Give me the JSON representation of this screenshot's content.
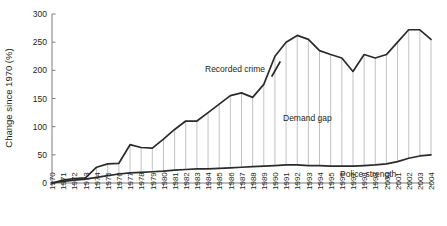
{
  "chart_data": {
    "type": "line",
    "title": "",
    "subtitle": "",
    "xlabel": "",
    "ylabel": "Change since 1970 (%)",
    "ylim": [
      0,
      300
    ],
    "yticks": [
      0,
      50,
      100,
      150,
      200,
      250,
      300
    ],
    "ytick_labels": [
      "0",
      "50",
      "100",
      "150",
      "200",
      "250",
      "300"
    ],
    "grid": false,
    "legend_position": "inline-annotations",
    "x": [
      1970,
      1971,
      1972,
      1973,
      1974,
      1975,
      1976,
      1977,
      1978,
      1979,
      1980,
      1981,
      1982,
      1983,
      1984,
      1985,
      1986,
      1987,
      1988,
      1989,
      1990,
      1991,
      1992,
      1993,
      1994,
      1995,
      1996,
      1997,
      1998,
      1999,
      2000,
      2001,
      2002,
      2003,
      2004
    ],
    "xtick_labels": [
      "1970",
      "1971",
      "1972",
      "1973",
      "1974",
      "1975",
      "1976",
      "1977",
      "1978",
      "1979",
      "1980",
      "1981",
      "1982",
      "1983",
      "1984",
      "1985",
      "1986",
      "1987",
      "1988",
      "1989",
      "1990",
      "1991",
      "1992",
      "1993",
      "1994",
      "1995",
      "1996",
      "1997",
      "1998",
      "1999",
      "2000",
      "2001",
      "2002",
      "2003",
      "2004"
    ],
    "series": [
      {
        "name": "Recorded crime",
        "annotation": "Recorded crime",
        "color": "#2b2b2b",
        "values": [
          0,
          5,
          8,
          9,
          28,
          34,
          35,
          68,
          63,
          62,
          78,
          95,
          110,
          110,
          125,
          140,
          155,
          160,
          152,
          175,
          225,
          250,
          262,
          255,
          235,
          228,
          222,
          198,
          228,
          222,
          228,
          250,
          272,
          272,
          255
        ]
      },
      {
        "name": "Police strength",
        "annotation": "Police strength",
        "color": "#2b2b2b",
        "values": [
          0,
          3,
          5,
          7,
          10,
          13,
          16,
          18,
          19,
          20,
          21,
          23,
          24,
          25,
          25,
          26,
          27,
          28,
          29,
          30,
          31,
          32,
          32,
          31,
          31,
          30,
          30,
          30,
          31,
          32,
          34,
          38,
          44,
          48,
          50
        ]
      }
    ],
    "filled_region": {
      "name": "Demand gap",
      "annotation": "Demand gap",
      "upper_series": "Recorded crime",
      "lower_series": "Police strength",
      "hatch": "vertical",
      "hatch_color": "#a8a8a8"
    },
    "colors": {
      "line": "#2b2b2b",
      "axis": "#7c7c7c",
      "hatch": "#a8a8a8",
      "text": "#231f20",
      "background": "#ffffff"
    }
  }
}
